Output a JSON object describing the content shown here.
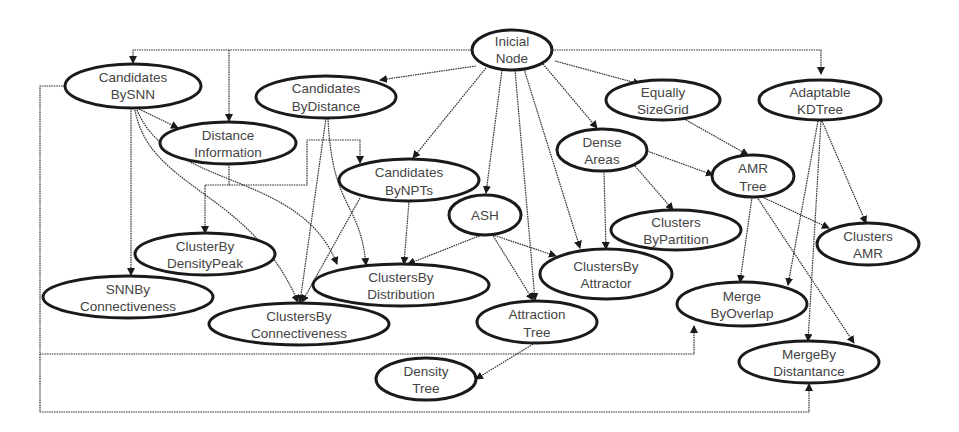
{
  "diagram": {
    "type": "directed-graph",
    "colors": {
      "node_stroke": "#1a1a1a",
      "node_fill": "#ffffff",
      "text": "#444444",
      "edge": "#333333",
      "background": "#ffffff"
    },
    "nodes": [
      {
        "id": "inicial",
        "line1": "Inicial",
        "line2": "Node"
      },
      {
        "id": "cand_snn",
        "line1": "Candidates",
        "line2": "BySNN"
      },
      {
        "id": "cand_dist",
        "line1": "Candidates",
        "line2": "ByDistance"
      },
      {
        "id": "dist_info",
        "line1": "Distance",
        "line2": "Information"
      },
      {
        "id": "cand_npts",
        "line1": "Candidates",
        "line2": "ByNPTs"
      },
      {
        "id": "eq_grid",
        "line1": "Equally",
        "line2": "SizeGrid"
      },
      {
        "id": "kdtree",
        "line1": "Adaptable",
        "line2": "KDTree"
      },
      {
        "id": "dense",
        "line1": "Dense",
        "line2": "Areas"
      },
      {
        "id": "amr_tree",
        "line1": "AMR",
        "line2": "Tree"
      },
      {
        "id": "ash",
        "line1": "ASH",
        "line2": ""
      },
      {
        "id": "cl_part",
        "line1": "Clusters",
        "line2": "ByPartition"
      },
      {
        "id": "cl_amr",
        "line1": "Clusters",
        "line2": "AMR"
      },
      {
        "id": "cl_peak",
        "line1": "ClusterBy",
        "line2": "DensityPeak"
      },
      {
        "id": "snn_conn",
        "line1": "SNNBy",
        "line2": "Connectiveness"
      },
      {
        "id": "cl_distr",
        "line1": "ClustersBy",
        "line2": "Distribution"
      },
      {
        "id": "cl_attr",
        "line1": "ClustersBy",
        "line2": "Attractor"
      },
      {
        "id": "cl_conn",
        "line1": "ClustersBy",
        "line2": "Connectiveness"
      },
      {
        "id": "attr_tree",
        "line1": "Attraction",
        "line2": "Tree"
      },
      {
        "id": "merge_ov",
        "line1": "Merge",
        "line2": "ByOverlap"
      },
      {
        "id": "merge_dist",
        "line1": "MergeBy",
        "line2": "Distantance"
      },
      {
        "id": "dens_tree",
        "line1": "Density",
        "line2": "Tree"
      }
    ],
    "edges": [
      {
        "from": "inicial",
        "to": "cand_snn"
      },
      {
        "from": "inicial",
        "to": "dist_info"
      },
      {
        "from": "inicial",
        "to": "cand_dist"
      },
      {
        "from": "inicial",
        "to": "cand_npts"
      },
      {
        "from": "inicial",
        "to": "ash"
      },
      {
        "from": "inicial",
        "to": "attr_tree"
      },
      {
        "from": "inicial",
        "to": "cl_attr"
      },
      {
        "from": "inicial",
        "to": "dense"
      },
      {
        "from": "inicial",
        "to": "eq_grid"
      },
      {
        "from": "inicial",
        "to": "kdtree"
      },
      {
        "from": "cand_snn",
        "to": "dist_info"
      },
      {
        "from": "cand_snn",
        "to": "snn_conn"
      },
      {
        "from": "cand_snn",
        "to": "cl_conn"
      },
      {
        "from": "cand_snn",
        "to": "cl_distr"
      },
      {
        "from": "cand_snn",
        "to": "merge_ov"
      },
      {
        "from": "cand_snn",
        "to": "merge_dist"
      },
      {
        "from": "cand_dist",
        "to": "cl_conn"
      },
      {
        "from": "cand_dist",
        "to": "cl_distr"
      },
      {
        "from": "dist_info",
        "to": "cl_peak"
      },
      {
        "from": "dist_info",
        "to": "cand_npts"
      },
      {
        "from": "cand_npts",
        "to": "cl_distr"
      },
      {
        "from": "cand_npts",
        "to": "cl_conn"
      },
      {
        "from": "ash",
        "to": "cl_distr"
      },
      {
        "from": "ash",
        "to": "cl_attr"
      },
      {
        "from": "ash",
        "to": "attr_tree"
      },
      {
        "from": "dense",
        "to": "cl_attr"
      },
      {
        "from": "dense",
        "to": "cl_part"
      },
      {
        "from": "dense",
        "to": "amr_tree"
      },
      {
        "from": "eq_grid",
        "to": "amr_tree"
      },
      {
        "from": "amr_tree",
        "to": "cl_amr"
      },
      {
        "from": "amr_tree",
        "to": "merge_ov"
      },
      {
        "from": "amr_tree",
        "to": "merge_dist"
      },
      {
        "from": "kdtree",
        "to": "cl_amr"
      },
      {
        "from": "kdtree",
        "to": "merge_ov"
      },
      {
        "from": "kdtree",
        "to": "merge_dist"
      },
      {
        "from": "attr_tree",
        "to": "dens_tree"
      }
    ]
  }
}
